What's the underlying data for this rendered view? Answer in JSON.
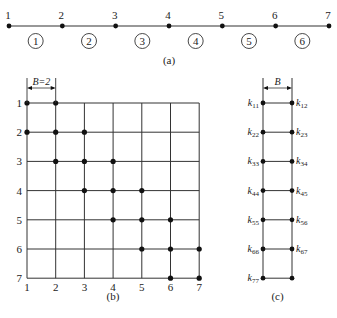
{
  "panel_a": {
    "caption": "(a)",
    "nodes": [
      "1",
      "2",
      "3",
      "4",
      "5",
      "6",
      "7"
    ],
    "elements": [
      "1",
      "2",
      "3",
      "4",
      "5",
      "6"
    ]
  },
  "panel_b": {
    "caption": "(b)",
    "bandwidth_label": "B=2",
    "row_labels": [
      "1",
      "2",
      "3",
      "4",
      "5",
      "6",
      "7"
    ],
    "col_labels": [
      "1",
      "2",
      "3",
      "4",
      "5",
      "6",
      "7"
    ],
    "nonzero_entries": [
      [
        1,
        1
      ],
      [
        1,
        2
      ],
      [
        2,
        1
      ],
      [
        2,
        2
      ],
      [
        2,
        3
      ],
      [
        3,
        2
      ],
      [
        3,
        3
      ],
      [
        3,
        4
      ],
      [
        4,
        3
      ],
      [
        4,
        4
      ],
      [
        4,
        5
      ],
      [
        5,
        4
      ],
      [
        5,
        5
      ],
      [
        5,
        6
      ],
      [
        6,
        5
      ],
      [
        6,
        6
      ],
      [
        6,
        7
      ],
      [
        7,
        6
      ],
      [
        7,
        7
      ]
    ]
  },
  "panel_c": {
    "caption": "(c)",
    "bandwidth_label": "B",
    "left_labels": [
      {
        "k": "k",
        "sub": "11"
      },
      {
        "k": "k",
        "sub": "22"
      },
      {
        "k": "k",
        "sub": "33"
      },
      {
        "k": "k",
        "sub": "44"
      },
      {
        "k": "k",
        "sub": "55"
      },
      {
        "k": "k",
        "sub": "66"
      },
      {
        "k": "k",
        "sub": "77"
      }
    ],
    "right_labels": [
      {
        "k": "k",
        "sub": "12"
      },
      {
        "k": "k",
        "sub": "23"
      },
      {
        "k": "k",
        "sub": "34"
      },
      {
        "k": "k",
        "sub": "45"
      },
      {
        "k": "k",
        "sub": "56"
      },
      {
        "k": "k",
        "sub": "67"
      }
    ]
  }
}
